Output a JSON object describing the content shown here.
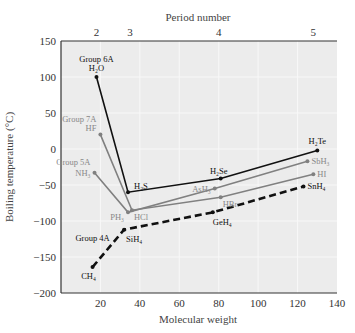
{
  "chart_data": {
    "type": "line",
    "title": "",
    "top_axis_label": "Period number",
    "top_axis_ticks": [
      {
        "label": "2",
        "x": 18
      },
      {
        "label": "3",
        "x": 35
      },
      {
        "label": "4",
        "x": 80
      },
      {
        "label": "5",
        "x": 128
      }
    ],
    "xlabel": "Molecular weight",
    "ylabel": "Boiling temperature (°C)",
    "xlim": [
      0,
      140
    ],
    "ylim": [
      -200,
      150
    ],
    "xticks": [
      20,
      40,
      60,
      80,
      100,
      120,
      140
    ],
    "yticks": [
      150,
      100,
      50,
      0,
      -50,
      -100,
      -150,
      -200
    ],
    "grid": true,
    "series": [
      {
        "name": "Group 6A",
        "color": "#111111",
        "dashed": false,
        "points": [
          {
            "label": "H2O",
            "x": 18,
            "y": 100
          },
          {
            "label": "H2S",
            "x": 34,
            "y": -60
          },
          {
            "label": "H2Se",
            "x": 81,
            "y": -41
          },
          {
            "label": "H2Te",
            "x": 130,
            "y": -2
          }
        ]
      },
      {
        "name": "Group 7A",
        "color": "#808080",
        "dashed": false,
        "points": [
          {
            "label": "HF",
            "x": 20,
            "y": 20
          },
          {
            "label": "HCl",
            "x": 36,
            "y": -85
          },
          {
            "label": "HBr",
            "x": 81,
            "y": -67
          },
          {
            "label": "HI",
            "x": 128,
            "y": -35
          }
        ]
      },
      {
        "name": "Group 5A",
        "color": "#808080",
        "dashed": false,
        "points": [
          {
            "label": "NH3",
            "x": 17,
            "y": -33
          },
          {
            "label": "PH3",
            "x": 34,
            "y": -88
          },
          {
            "label": "AsH3",
            "x": 78,
            "y": -55
          },
          {
            "label": "SbH3",
            "x": 125,
            "y": -17
          }
        ]
      },
      {
        "name": "Group 4A",
        "color": "#111111",
        "dashed": true,
        "points": [
          {
            "label": "CH4",
            "x": 16,
            "y": -164
          },
          {
            "label": "SiH4",
            "x": 32,
            "y": -112
          },
          {
            "label": "GeH4",
            "x": 77,
            "y": -88
          },
          {
            "label": "SnH4",
            "x": 123,
            "y": -52
          }
        ]
      }
    ],
    "annotations": [
      {
        "text": "Group 6A",
        "for": "H2O"
      },
      {
        "text": "Group 7A",
        "for": "HF"
      },
      {
        "text": "Group 5A",
        "for": "NH3"
      },
      {
        "text": "Group 4A",
        "for": "CH4"
      }
    ]
  }
}
